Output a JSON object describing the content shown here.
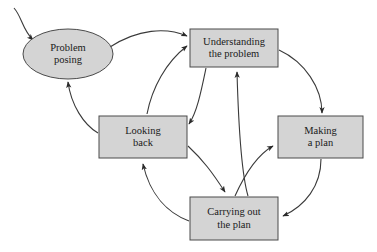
{
  "diagram": {
    "colors": {
      "node_fill": "#d4d4d4",
      "node_stroke": "#4a4a4a",
      "edge_stroke": "#3a3a3a",
      "background": "#ffffff",
      "text": "#1a1a1a"
    },
    "nodes": [
      {
        "id": "problem-posing",
        "label": "Problem\nposing",
        "shape": "ellipse",
        "cx": 68,
        "cy": 54,
        "rx": 45,
        "ry": 25
      },
      {
        "id": "understanding-the-problem",
        "label": "Understanding\nthe problem",
        "shape": "rect",
        "x": 190,
        "y": 29,
        "width": 88,
        "height": 38
      },
      {
        "id": "looking-back",
        "label": "Looking\nback",
        "shape": "rect",
        "x": 99,
        "y": 116,
        "width": 88,
        "height": 42
      },
      {
        "id": "making-a-plan",
        "label": "Making\na plan",
        "shape": "rect",
        "x": 278,
        "y": 116,
        "width": 85,
        "height": 42
      },
      {
        "id": "carrying-out-the-plan",
        "label": "Carrying out\nthe plan",
        "shape": "rect",
        "x": 190,
        "y": 197,
        "width": 88,
        "height": 43
      }
    ],
    "edges": [
      {
        "id": "entry-to-problem-posing",
        "from": "external",
        "to": "problem-posing"
      },
      {
        "id": "problem-posing-to-understanding",
        "from": "problem-posing",
        "to": "understanding-the-problem"
      },
      {
        "id": "understanding-to-making-a-plan",
        "from": "understanding-the-problem",
        "to": "making-a-plan"
      },
      {
        "id": "making-a-plan-to-carrying-out",
        "from": "making-a-plan",
        "to": "carrying-out-the-plan"
      },
      {
        "id": "carrying-out-to-looking-back",
        "from": "carrying-out-the-plan",
        "to": "looking-back"
      },
      {
        "id": "looking-back-to-problem-posing",
        "from": "looking-back",
        "to": "problem-posing"
      },
      {
        "id": "looking-back-to-understanding",
        "from": "looking-back",
        "to": "understanding-the-problem"
      },
      {
        "id": "understanding-to-looking-back",
        "from": "understanding-the-problem",
        "to": "looking-back"
      },
      {
        "id": "looking-back-to-carrying-out",
        "from": "looking-back",
        "to": "carrying-out-the-plan"
      },
      {
        "id": "carrying-out-to-understanding",
        "from": "carrying-out-the-plan",
        "to": "understanding-the-problem"
      },
      {
        "id": "carrying-out-to-making-a-plan",
        "from": "carrying-out-the-plan",
        "to": "making-a-plan"
      }
    ]
  }
}
